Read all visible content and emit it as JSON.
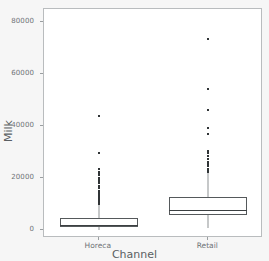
{
  "chart_data": {
    "type": "box",
    "title": "",
    "xlabel": "Channel",
    "ylabel": "Milk",
    "categories": [
      "Horeca",
      "Retail"
    ],
    "ylim": [
      -3000,
      85000
    ],
    "yticks": [
      0,
      20000,
      40000,
      60000,
      80000
    ],
    "ytick_labels": [
      "0",
      "20000",
      "40000",
      "60000",
      "80000"
    ],
    "grid": false,
    "legend": null,
    "boxes": [
      {
        "category": "Horeca",
        "whisker_low": 55,
        "q1": 1134,
        "median": 1949,
        "q3": 4764,
        "whisker_high": 9980,
        "fliers": [
          10069,
          10131,
          10302,
          10452,
          10685,
          10810,
          11093,
          11577,
          11688,
          12212,
          12669,
          13135,
          13567,
          14215,
          15076,
          16027,
          16545,
          17107,
          18028,
          18664,
          19410,
          20170,
          21042,
          21858,
          22272,
          23527,
          29627,
          43950
        ]
      },
      {
        "category": "Retail",
        "whisker_low": 928,
        "q1": 5938,
        "median": 7812,
        "q3": 12880,
        "whisker_high": 22035,
        "fliers": [
          22272,
          22615,
          23527,
          24502,
          25071,
          25862,
          26287,
          27167,
          28326,
          29627,
          30243,
          36847,
          39228,
          46197,
          54259,
          73498
        ]
      }
    ]
  },
  "axes": {
    "y_title": "Milk",
    "x_title": "Channel"
  },
  "colors": {
    "figure_background": "#f6f6f6",
    "axes_background": "#ffffff",
    "frame": "#b9bcbe",
    "box_edge": "#55595b",
    "median": "#3c4042",
    "whisker": "#8e9294",
    "flier": "#303436",
    "tick_text": "#6f7376",
    "axis_title": "#5a5f62"
  }
}
